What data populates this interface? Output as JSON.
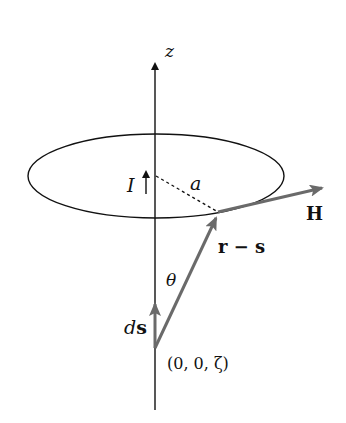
{
  "diagram": {
    "labels": {
      "z_axis": "z",
      "current": "I",
      "radius": "a",
      "field": "H",
      "displacement": "r − s",
      "angle": "θ",
      "element_d": "d",
      "element_s": "s",
      "origin_point": "(0, 0, ζ)"
    },
    "colors": {
      "line": "#111111",
      "vector": "#6a6a6a",
      "background": "#ffffff"
    }
  }
}
